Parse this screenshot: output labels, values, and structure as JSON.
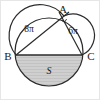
{
  "figure": {
    "type": "geometry-diagram",
    "background_color": "#ffffff",
    "stroke_color": "#2b2b2b",
    "shade_color": "#c9c9c9",
    "border_color": "#e2e2e2",
    "points": {
      "a": {
        "label": "A",
        "x": 64,
        "y": 16
      },
      "b": {
        "label": "B",
        "x": 16,
        "y": 55
      },
      "c": {
        "label": "C",
        "x": 82,
        "y": 55
      }
    },
    "labels": {
      "left_semicircle": "8π",
      "right_semicircle": "6π",
      "shaded_region": "S"
    },
    "big_circle": {
      "cx": 49,
      "cy": 52,
      "r": 34
    },
    "left_semicircle": {
      "cx": 40,
      "cy": 35.5,
      "r": 30.8
    },
    "right_semicircle": {
      "cx": 73,
      "cy": 35.5,
      "r": 21.5
    },
    "chord": {
      "x1": 16,
      "y1": 55,
      "x2": 82,
      "y2": 55
    }
  }
}
